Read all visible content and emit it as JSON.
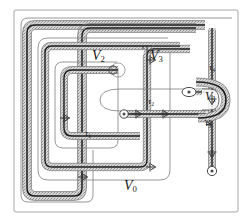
{
  "figure": {
    "name": "nested-spiral-handlebody-diagram",
    "kind": "topological-diagram",
    "background_color": "#ffffff",
    "frame_color": "#9a9a9a",
    "thin_curve_color": "#777777",
    "thick_curve_color": "#1a1a1a",
    "band_fill_color": "#c9c9c9",
    "label_color": "#1a1a1a"
  },
  "labels": {
    "v0": {
      "base": "V",
      "sub": "0",
      "x": 124,
      "y": 186
    },
    "v1": {
      "base": "V",
      "sub": "1",
      "x": 207,
      "y": 96
    },
    "v2": {
      "base": "V",
      "sub": "2",
      "x": 95,
      "y": 56
    },
    "v3": {
      "base": "V",
      "sub": "3",
      "x": 152,
      "y": 56
    },
    "tau1": {
      "base": "τ",
      "sub": "1",
      "x": 85,
      "y": 132
    },
    "tau2": {
      "base": "τ",
      "sub": "2",
      "x": 148,
      "y": 99
    },
    "tau3": {
      "base": "τ",
      "sub": "3",
      "x": 206,
      "y": 117
    },
    "tau4": {
      "base": "τ",
      "sub": "4",
      "x": 209,
      "y": 67
    }
  },
  "regions": [
    {
      "id": "V0",
      "label": "V0",
      "role": "outer-ambient-region"
    },
    {
      "id": "V1",
      "label": "V1",
      "role": "small-right-disk-region"
    },
    {
      "id": "V2",
      "label": "V2",
      "role": "inner-left-spiral-region"
    },
    {
      "id": "V3",
      "label": "V3",
      "role": "middle-spiral-region"
    }
  ],
  "maps": [
    {
      "id": "tau1",
      "label": "tau1",
      "role": "transition-map"
    },
    {
      "id": "tau2",
      "label": "tau2",
      "role": "transition-map"
    },
    {
      "id": "tau3",
      "label": "tau3",
      "role": "transition-map"
    },
    {
      "id": "tau4",
      "label": "tau4",
      "role": "transition-map"
    }
  ],
  "arrow_markers": [
    {
      "id": "a1",
      "x": 150,
      "y": 60,
      "dir": "right"
    },
    {
      "id": "a2",
      "x": 150,
      "y": 148,
      "dir": "right"
    },
    {
      "id": "a3",
      "x": 62,
      "y": 118,
      "dir": "right"
    },
    {
      "id": "a4",
      "x": 80,
      "y": 176,
      "dir": "right"
    },
    {
      "id": "a5",
      "x": 212,
      "y": 99,
      "dir": "down"
    },
    {
      "id": "a6",
      "x": 212,
      "y": 152,
      "dir": "down"
    },
    {
      "id": "a7",
      "x": 136,
      "y": 114,
      "dir": "right"
    },
    {
      "id": "a8",
      "x": 163,
      "y": 114,
      "dir": "right"
    }
  ]
}
